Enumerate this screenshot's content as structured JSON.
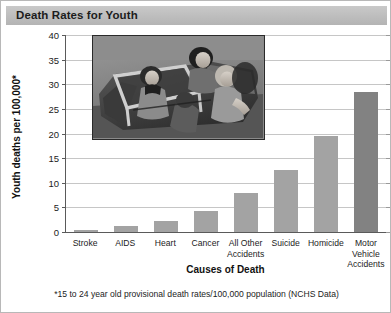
{
  "header": {
    "title": "Death Rates for Youth"
  },
  "footnote": "*15 to 24 year old provisional death rates/100,000 population (NCHS Data)",
  "photo": {
    "caption": "black-and-white photograph of teenagers riding in an open convertible car"
  },
  "chart_data": {
    "type": "bar",
    "title": "Death Rates for Youth",
    "xlabel": "Causes of Death",
    "ylabel": "Youth deaths per 100,000*",
    "categories": [
      "Stroke",
      "AIDS",
      "Heart",
      "Cancer",
      "All Other Accidents",
      "Suicide",
      "Homicide",
      "Motor Vehicle Accidents"
    ],
    "values": [
      0.5,
      1.3,
      2.3,
      4.3,
      8.0,
      12.5,
      19.5,
      28.5
    ],
    "ylim": [
      0,
      40
    ],
    "yticks": [
      0,
      5,
      10,
      15,
      20,
      25,
      30,
      35,
      40
    ],
    "ytick_labels": [
      "0",
      "5",
      "10",
      "15",
      "20",
      "25",
      "30",
      "35",
      "40"
    ],
    "grid": true,
    "legend": "none",
    "bar_color": "#a3a3a3",
    "highlight_color": "#828282",
    "highlight_index": 7,
    "note": "*15 to 24 year old provisional death rates/100,000 population (NCHS Data)"
  }
}
